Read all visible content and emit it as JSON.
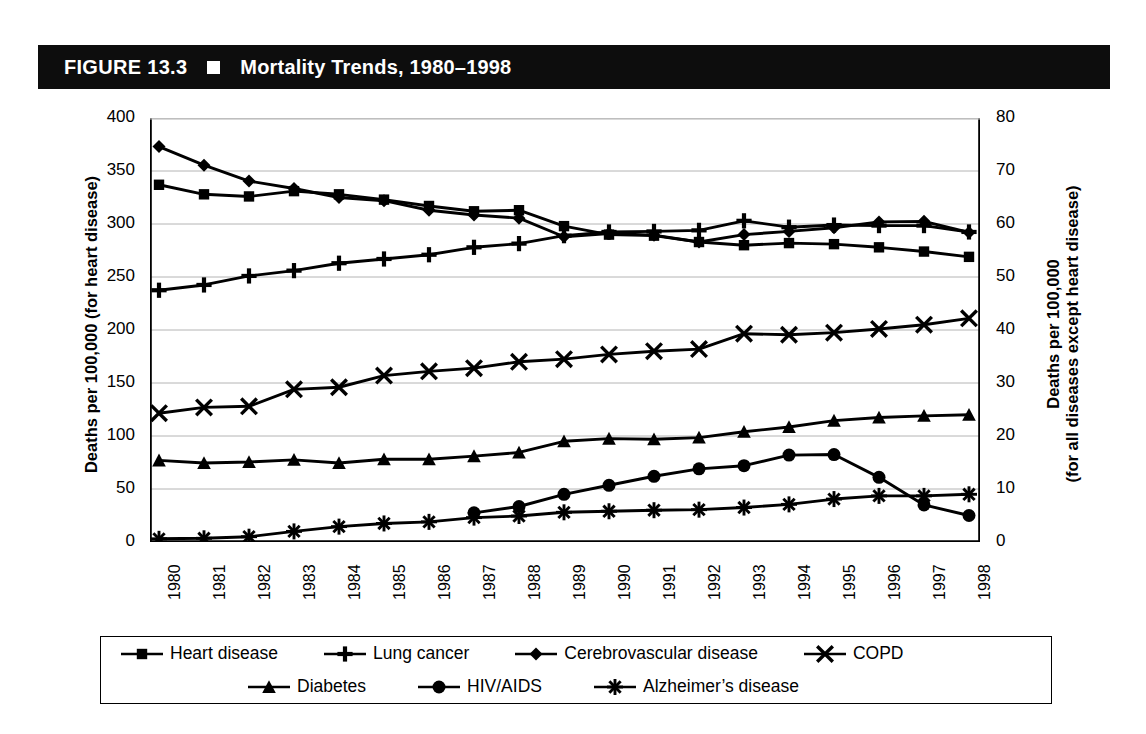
{
  "figure": {
    "label": "FIGURE 13.3",
    "square_icon": "black-square-icon",
    "title": "Mortality Trends, 1980–1998"
  },
  "axes": {
    "left_title": "Deaths per 100,000 (for heart disease)",
    "right_title_line1": "Deaths per 100,000",
    "right_title_line2": "(for all diseases except heart disease)"
  },
  "colors": {
    "ink": "#000000",
    "title_bar_bg": "#0d0d0d",
    "title_bar_fg": "#ffffff",
    "gridline": "#b4b4b4",
    "page_bg": "#ffffff"
  },
  "legend": {
    "rows": [
      [
        {
          "label": "Heart disease",
          "marker": "square-marker-icon"
        },
        {
          "label": "Lung cancer",
          "marker": "plus-marker-icon"
        },
        {
          "label": "Cerebrovascular disease",
          "marker": "diamond-marker-icon"
        },
        {
          "label": "COPD",
          "marker": "cross-marker-icon"
        }
      ],
      [
        {
          "label": "Diabetes",
          "marker": "triangle-marker-icon"
        },
        {
          "label": "HIV/AIDS",
          "marker": "circle-marker-icon"
        },
        {
          "label": "Alzheimer’s disease",
          "marker": "asterisk-marker-icon"
        }
      ]
    ]
  },
  "chart_data": {
    "type": "line",
    "title": "Mortality Trends, 1980–1998",
    "xlabel": "",
    "ylabel": "Deaths per 100,000 (for heart disease)",
    "ylabel_secondary": "Deaths per 100,000 (for all diseases except heart disease)",
    "grid": true,
    "legend_position": "bottom",
    "categories": [
      "1980",
      "1981",
      "1982",
      "1983",
      "1984",
      "1985",
      "1986",
      "1987",
      "1988",
      "1989",
      "1990",
      "1991",
      "1992",
      "1993",
      "1994",
      "1995",
      "1996",
      "1997",
      "1998"
    ],
    "x": [
      1980,
      1981,
      1982,
      1983,
      1984,
      1985,
      1986,
      1987,
      1988,
      1989,
      1990,
      1991,
      1992,
      1993,
      1994,
      1995,
      1996,
      1997,
      1998
    ],
    "ylim": [
      0,
      400
    ],
    "yticks": [
      0,
      50,
      100,
      150,
      200,
      250,
      300,
      350,
      400
    ],
    "ylim_secondary": [
      0,
      80
    ],
    "yticks_secondary": [
      0,
      10,
      20,
      30,
      40,
      50,
      60,
      70,
      80
    ],
    "series": [
      {
        "name": "Heart disease",
        "marker": "square-marker-icon",
        "axis": "left",
        "values": [
          337,
          328,
          326,
          331,
          328,
          323,
          317,
          312,
          313,
          298,
          290,
          289,
          283,
          280,
          282,
          281,
          278,
          274,
          269
        ]
      },
      {
        "name": "Lung cancer",
        "marker": "plus-marker-icon",
        "axis": "right",
        "values": [
          47.5,
          48.5,
          50.2,
          51.2,
          52.6,
          53.4,
          54.2,
          55.6,
          56.3,
          57.8,
          58.5,
          58.6,
          58.8,
          60.6,
          59.4,
          59.8,
          59.7,
          59.7,
          58.5
        ]
      },
      {
        "name": "Cerebrovascular disease",
        "marker": "diamond-marker-icon",
        "axis": "right",
        "values": [
          74.6,
          71.1,
          68.1,
          66.7,
          65.0,
          64.4,
          62.6,
          61.7,
          61.1,
          57.6,
          58.2,
          57.9,
          56.6,
          58.0,
          58.6,
          59.3,
          60.4,
          60.5,
          58.4
        ]
      },
      {
        "name": "COPD",
        "marker": "cross-marker-icon",
        "axis": "right",
        "values": [
          24.3,
          25.4,
          25.6,
          28.8,
          29.2,
          31.4,
          32.2,
          32.8,
          34.0,
          34.5,
          35.4,
          36.0,
          36.4,
          39.3,
          39.1,
          39.5,
          40.2,
          41.0,
          42.2
        ]
      },
      {
        "name": "Diabetes",
        "marker": "triangle-marker-icon",
        "axis": "right",
        "values": [
          15.4,
          14.9,
          15.1,
          15.5,
          14.9,
          15.6,
          15.6,
          16.2,
          16.9,
          19.0,
          19.5,
          19.4,
          19.7,
          20.8,
          21.7,
          22.9,
          23.5,
          23.8,
          24.0
        ]
      },
      {
        "name": "HIV/AIDS",
        "marker": "circle-marker-icon",
        "axis": "right",
        "values": [
          null,
          null,
          null,
          null,
          null,
          null,
          null,
          5.5,
          6.7,
          9.0,
          10.7,
          12.4,
          13.8,
          14.4,
          16.4,
          16.5,
          12.2,
          7.0,
          5.0
        ]
      },
      {
        "name": "Alzheimer’s disease",
        "marker": "asterisk-marker-icon",
        "axis": "right",
        "values": [
          0.6,
          0.7,
          1.0,
          2.0,
          2.9,
          3.5,
          3.8,
          4.6,
          4.9,
          5.6,
          5.8,
          6.0,
          6.1,
          6.5,
          7.1,
          8.1,
          8.7,
          8.7,
          9.0
        ]
      }
    ]
  }
}
